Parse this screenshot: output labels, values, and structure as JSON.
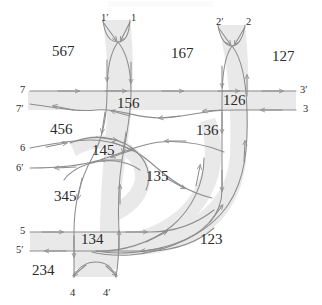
{
  "figure": {
    "kind": "curve-arrangement-diagram",
    "width": 322,
    "height": 305,
    "background_color": "#ffffff",
    "band_fill_color": "#e9e9e9",
    "curve_stroke_color": "#8c8c8c",
    "label_text_color": "#2b2b2b"
  },
  "region_labels": [
    {
      "id": "region-567",
      "text": "567",
      "x": 52,
      "y": 52
    },
    {
      "id": "region-167",
      "text": "167",
      "x": 171,
      "y": 54
    },
    {
      "id": "region-127",
      "text": "127",
      "x": 272,
      "y": 57
    },
    {
      "id": "region-156",
      "text": "156",
      "x": 117,
      "y": 104
    },
    {
      "id": "region-126",
      "text": "126",
      "x": 223,
      "y": 101
    },
    {
      "id": "region-456",
      "text": "456",
      "x": 50,
      "y": 130
    },
    {
      "id": "region-136",
      "text": "136",
      "x": 196,
      "y": 131
    },
    {
      "id": "region-145",
      "text": "145",
      "x": 92,
      "y": 151
    },
    {
      "id": "region-135",
      "text": "135",
      "x": 146,
      "y": 177
    },
    {
      "id": "region-345",
      "text": "345",
      "x": 54,
      "y": 197
    },
    {
      "id": "region-123",
      "text": "123",
      "x": 200,
      "y": 240
    },
    {
      "id": "region-134",
      "text": "134",
      "x": 81,
      "y": 240
    },
    {
      "id": "region-234",
      "text": "234",
      "x": 32,
      "y": 271
    }
  ],
  "endpoint_labels": [
    {
      "id": "endpoint-1-prime",
      "text": "1′",
      "x": 101,
      "y": 13,
      "side": "top"
    },
    {
      "id": "endpoint-1",
      "text": "1",
      "x": 131,
      "y": 13,
      "side": "top"
    },
    {
      "id": "endpoint-2-prime",
      "text": "2′",
      "x": 216,
      "y": 17,
      "side": "top"
    },
    {
      "id": "endpoint-2",
      "text": "2",
      "x": 246,
      "y": 17,
      "side": "top"
    },
    {
      "id": "endpoint-7",
      "text": "7",
      "x": 20,
      "y": 87,
      "side": "left"
    },
    {
      "id": "endpoint-7-prime",
      "text": "7′",
      "x": 18,
      "y": 106,
      "side": "left"
    },
    {
      "id": "endpoint-3-prime",
      "text": "3′",
      "x": 300,
      "y": 88,
      "side": "right"
    },
    {
      "id": "endpoint-3",
      "text": "3",
      "x": 302,
      "y": 108,
      "side": "right"
    },
    {
      "id": "endpoint-6",
      "text": "6",
      "x": 20,
      "y": 149,
      "side": "left"
    },
    {
      "id": "endpoint-6-prime",
      "text": "6′",
      "x": 18,
      "y": 168,
      "side": "left"
    },
    {
      "id": "endpoint-5",
      "text": "5",
      "x": 20,
      "y": 229,
      "side": "left"
    },
    {
      "id": "endpoint-5-prime",
      "text": "5′",
      "x": 18,
      "y": 249,
      "side": "left"
    },
    {
      "id": "endpoint-4",
      "text": "4",
      "x": 70,
      "y": 292,
      "side": "bottom"
    },
    {
      "id": "endpoint-4-prime",
      "text": "4′",
      "x": 104,
      "y": 292,
      "side": "bottom"
    }
  ]
}
